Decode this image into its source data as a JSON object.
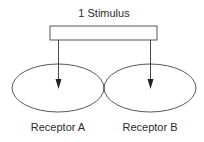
{
  "diagram": {
    "title": "1 Stimulus",
    "stimulus_box": {
      "x": 50,
      "y": 26,
      "width": 107,
      "height": 14
    },
    "receptors": [
      {
        "label": "Receptor A",
        "cx": 58,
        "cy": 88,
        "rx": 46,
        "ry": 24,
        "arrow_x": 58
      },
      {
        "label": "Receptor B",
        "cx": 150,
        "cy": 88,
        "rx": 46,
        "ry": 24,
        "arrow_x": 150
      }
    ],
    "colors": {
      "stroke": "#333333",
      "text": "#2a2a2a",
      "background": "#ffffff"
    }
  }
}
